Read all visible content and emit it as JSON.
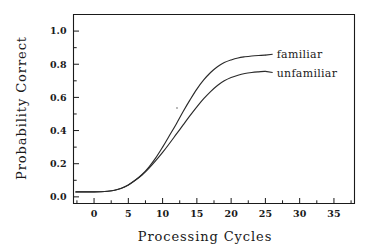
{
  "chart_data": {
    "type": "line",
    "title": "",
    "xlabel": "Processing Cycles",
    "ylabel": "Probability Correct",
    "xlim": [
      -3,
      38
    ],
    "ylim": [
      -0.04,
      1.1
    ],
    "grid": false,
    "legend_position": "right-inline-labels",
    "x_ticks_major": [
      0,
      5,
      10,
      15,
      20,
      25,
      30,
      35
    ],
    "x_ticklabels": [
      "0",
      "5",
      "10",
      "15",
      "20",
      "25",
      "30",
      "35"
    ],
    "x_ticks_minor": [
      -2.5,
      2.5,
      7.5,
      12.5,
      17.5,
      22.5,
      27.5,
      32.5,
      37.5
    ],
    "y_ticks_major": [
      0.0,
      0.2,
      0.4,
      0.6,
      0.8,
      1.0
    ],
    "y_ticklabels": [
      "0.0",
      "0.2",
      "0.4",
      "0.6",
      "0.8",
      "1.0"
    ],
    "y_ticks_minor": [
      0.1,
      0.3,
      0.5,
      0.7,
      0.9
    ],
    "x": [
      0,
      1,
      2,
      3,
      4,
      5,
      6,
      7,
      8,
      9,
      10,
      11,
      12,
      13,
      14,
      15,
      16,
      17,
      18,
      19,
      20,
      21,
      22,
      23,
      24,
      25
    ],
    "series": [
      {
        "name": "familiar",
        "label_x": 26.5,
        "label_y": 0.845,
        "values": [
          0.03,
          0.031,
          0.034,
          0.04,
          0.052,
          0.072,
          0.1,
          0.135,
          0.18,
          0.235,
          0.3,
          0.37,
          0.44,
          0.515,
          0.585,
          0.65,
          0.705,
          0.75,
          0.785,
          0.81,
          0.826,
          0.838,
          0.845,
          0.85,
          0.853,
          0.855
        ]
      },
      {
        "name": "unfamiliar",
        "label_x": 26.5,
        "label_y": 0.735,
        "values": [
          0.03,
          0.031,
          0.034,
          0.04,
          0.052,
          0.072,
          0.1,
          0.132,
          0.172,
          0.218,
          0.268,
          0.322,
          0.378,
          0.434,
          0.49,
          0.543,
          0.592,
          0.635,
          0.672,
          0.7,
          0.72,
          0.734,
          0.744,
          0.75,
          0.754,
          0.757
        ]
      }
    ]
  },
  "axis_titles": {
    "x": "Processing Cycles",
    "y": "Probability Correct"
  },
  "colors": {
    "curve": "#2a2a2a",
    "axis": "#1a1a1a",
    "background": "#ffffff"
  }
}
